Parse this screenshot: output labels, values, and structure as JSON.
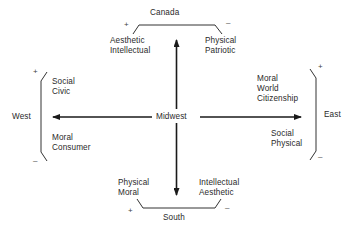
{
  "diagram": {
    "center": "Midwest",
    "north": {
      "region": "Canada",
      "plus_side": [
        "Aesthetic",
        "Intellectual"
      ],
      "minus_side": [
        "Physical",
        "Patriotic"
      ],
      "plus": "+",
      "minus": "–"
    },
    "south": {
      "region": "South",
      "plus_side": [
        "Physical",
        "Moral"
      ],
      "minus_side": [
        "Intellectual",
        "Aesthetic"
      ],
      "plus": "+",
      "minus": "–"
    },
    "west": {
      "region": "West",
      "plus_side": [
        "Social",
        "Civic"
      ],
      "minus_side": [
        "Moral",
        "Consumer"
      ],
      "plus": "+",
      "minus": "–"
    },
    "east": {
      "region": "East",
      "plus_side": [
        "Moral",
        "World",
        "Citizenship"
      ],
      "minus_side": [
        "Social",
        "Physical"
      ],
      "plus": "+",
      "minus": "–"
    },
    "colors": {
      "ink": "#2a2a2a",
      "background": "#ffffff"
    }
  }
}
